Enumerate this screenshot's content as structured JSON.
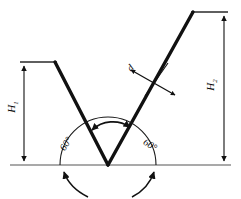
{
  "diagram": {
    "colors": {
      "profile_stroke": "#111111",
      "dimension_stroke": "#444444",
      "baseline_stroke": "#555555",
      "background": "#ffffff",
      "text": "#0a0a0a"
    },
    "labels": {
      "height_left": {
        "symbol": "H",
        "subscript": "1",
        "name": "H1"
      },
      "height_right": {
        "symbol": "H",
        "subscript": "2",
        "name": "H2"
      },
      "angle_left": "60°",
      "angle_right": "60°",
      "thickness": "d"
    },
    "geometry": {
      "apex": {
        "x": 108,
        "y": 165
      },
      "left_leg_top": {
        "x": 55,
        "y": 62
      },
      "right_leg_top": {
        "x": 193,
        "y": 12
      },
      "left_extension_end": {
        "x": 20,
        "y": 62
      },
      "right_extension_end": {
        "x": 228,
        "y": 12
      },
      "baseline_y": 165,
      "baseline_x_start": 10,
      "baseline_x_end": 231,
      "arc_radius": 48,
      "included_angle_arc_radius": 30
    },
    "annotations": {
      "rotation_arrow_left": "curved-arrow-left",
      "rotation_arrow_right": "curved-arrow-right",
      "included_angle_arrow": "double-headed-arc-arrow"
    }
  }
}
